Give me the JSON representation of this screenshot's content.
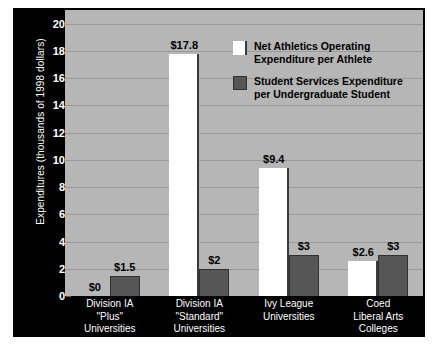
{
  "chart_data": {
    "type": "bar",
    "title": "",
    "subtitle": "",
    "xlabel": "",
    "ylabel": "Expenditures (thousands of 1998 dollars)",
    "ylim": [
      0,
      21
    ],
    "yticks": [
      0,
      2,
      4,
      6,
      8,
      10,
      12,
      14,
      16,
      18,
      20
    ],
    "ytick_labels": [
      "0",
      "2",
      "4",
      "6",
      "8",
      "10",
      "12",
      "14",
      "16",
      "18",
      "20"
    ],
    "grid": true,
    "legend_position": "upper-center",
    "categories": [
      "Division IA\n\"Plus\"\nUniversities",
      "Division IA\n\"Standard\"\nUniversities",
      "Ivy League\nUniversities",
      "Coed\nLiberal Arts\nColleges"
    ],
    "series": [
      {
        "name": "Net Athletics Operating Expenditure per Athlete",
        "color": "#ffffff",
        "values": [
          0,
          17.8,
          9.4,
          2.6
        ],
        "data_labels": [
          "$0",
          "$17.8",
          "$9.4",
          "$2.6"
        ]
      },
      {
        "name": "Student Services Expenditure per Undergraduate Student",
        "color": "#565656",
        "values": [
          1.5,
          2,
          3,
          3
        ],
        "data_labels": [
          "$1.5",
          "$2",
          "$3",
          "$3"
        ]
      }
    ]
  },
  "legend": {
    "items": [
      {
        "swatch": "white",
        "line1": "Net Athletics Operating",
        "line2": "Expenditure per Athlete"
      },
      {
        "swatch": "dark",
        "line1": "Student Services Expenditure",
        "line2": "per Undergraduate Student"
      }
    ]
  },
  "colors": {
    "figure_background": "#000000",
    "plot_background": "#b6b6b6",
    "gridline": "#9a9a9a",
    "axis_text": "#ffffff",
    "label_text": "#000000",
    "series_white": "#ffffff",
    "series_dark": "#565656"
  }
}
